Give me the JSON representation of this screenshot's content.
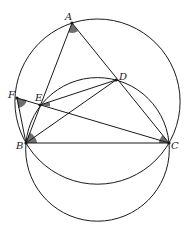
{
  "diagram": {
    "type": "geometry",
    "points": {
      "A": {
        "label": "A",
        "x": 72,
        "y": 23
      },
      "B": {
        "label": "B",
        "x": 26,
        "y": 143
      },
      "C": {
        "label": "C",
        "x": 169,
        "y": 143
      },
      "D": {
        "label": "D",
        "x": 116,
        "y": 80
      },
      "E": {
        "label": "E",
        "x": 40,
        "y": 105
      },
      "F": {
        "label": "F",
        "x": 17,
        "y": 98
      }
    },
    "segments": [
      "AB",
      "AC",
      "BC",
      "BD",
      "ED",
      "FC",
      "FB"
    ],
    "circles": [
      {
        "name": "circumcircle-ABC",
        "cx": 97.5,
        "cy": 101.6,
        "r": 82.6
      },
      {
        "name": "circle-BEDC",
        "cx": 97.5,
        "cy": 149.4,
        "r": 71.8
      }
    ],
    "marked_angles": [
      "BAC",
      "BFC",
      "BED",
      "DBC",
      "BCF"
    ],
    "colors": {
      "line": "#1a1a1a",
      "angle_fill": "#6e6e6e",
      "background": "#ffffff"
    }
  }
}
